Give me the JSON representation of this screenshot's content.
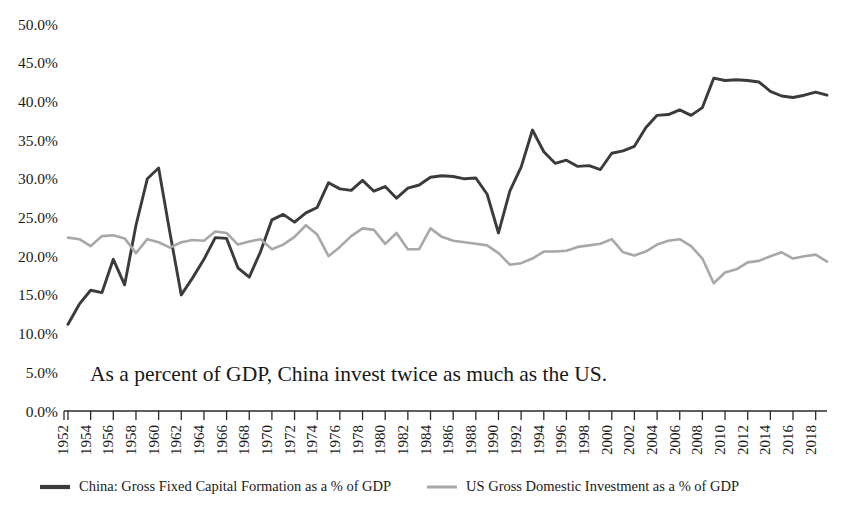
{
  "annotation": {
    "text": "As a percent of GDP, China invest twice as much as the US."
  },
  "axes": {
    "y_tick_labels": [
      "50.0%",
      "45.0%",
      "40.0%",
      "35.0%",
      "30.0%",
      "25.0%",
      "20.0%",
      "15.0%",
      "10.0%",
      "5.0%",
      "0.0%"
    ],
    "x_tick_labels": [
      "1952",
      "1954",
      "1956",
      "1958",
      "1960",
      "1962",
      "1964",
      "1966",
      "1968",
      "1970",
      "1972",
      "1974",
      "1976",
      "1978",
      "1980",
      "1982",
      "1984",
      "1986",
      "1988",
      "1990",
      "1992",
      "1994",
      "1996",
      "1998",
      "2000",
      "2002",
      "2004",
      "2006",
      "2008",
      "2010",
      "2012",
      "2014",
      "2016",
      "2018"
    ]
  },
  "legend": {
    "items": [
      {
        "label": "China: Gross Fixed Capital Formation as a % of GDP",
        "color": "#3b3b3b"
      },
      {
        "label": "US Gross Domestic Investment as a % of GDP",
        "color": "#a8a8a8"
      }
    ]
  },
  "colors": {
    "china_line": "#3b3b3b",
    "us_line": "#a8a8a8",
    "axis": "#2a2a2a",
    "text": "#1b1b1b",
    "background": "#ffffff"
  },
  "chart_data": {
    "type": "line",
    "title": "",
    "subtitle": "",
    "annotation": "As a percent of GDP, China invest twice as much as the US.",
    "xlabel": "",
    "ylabel": "",
    "ylim": [
      0,
      50
    ],
    "ytick_step": 5,
    "ytick_format": "percent",
    "xlim": [
      1952,
      2019
    ],
    "xtick_step": 2,
    "grid": false,
    "legend_position": "bottom",
    "x": [
      1952,
      1953,
      1954,
      1955,
      1956,
      1957,
      1958,
      1959,
      1960,
      1961,
      1962,
      1963,
      1964,
      1965,
      1966,
      1967,
      1968,
      1969,
      1970,
      1971,
      1972,
      1973,
      1974,
      1975,
      1976,
      1977,
      1978,
      1979,
      1980,
      1981,
      1982,
      1983,
      1984,
      1985,
      1986,
      1987,
      1988,
      1989,
      1990,
      1991,
      1992,
      1993,
      1994,
      1995,
      1996,
      1997,
      1998,
      1999,
      2000,
      2001,
      2002,
      2003,
      2004,
      2005,
      2006,
      2007,
      2008,
      2009,
      2010,
      2011,
      2012,
      2013,
      2014,
      2015,
      2016,
      2017,
      2018,
      2019
    ],
    "series": [
      {
        "name": "China: Gross Fixed Capital Formation as a % of GDP",
        "color": "#3b3b3b",
        "values": [
          11.2,
          13.8,
          15.6,
          15.3,
          19.6,
          16.3,
          24.0,
          30.0,
          31.4,
          23.0,
          15.0,
          17.2,
          19.6,
          22.4,
          22.3,
          18.5,
          17.3,
          20.6,
          24.7,
          25.4,
          24.4,
          25.6,
          26.3,
          29.5,
          28.7,
          28.5,
          29.8,
          28.4,
          29.0,
          27.5,
          28.8,
          29.2,
          30.2,
          30.4,
          30.3,
          30.0,
          30.1,
          28.0,
          23.0,
          28.4,
          31.5,
          36.3,
          33.5,
          32.0,
          32.4,
          31.6,
          31.7,
          31.2,
          33.3,
          33.6,
          34.2,
          36.6,
          38.2,
          38.3,
          38.9,
          38.2,
          39.2,
          43.0,
          42.7,
          42.8,
          42.7,
          42.5,
          41.3,
          40.7,
          40.5,
          40.8,
          41.2,
          40.8
        ]
      },
      {
        "name": "US Gross Domestic Investment as a % of GDP",
        "color": "#a8a8a8",
        "values": [
          22.4,
          22.2,
          21.3,
          22.6,
          22.7,
          22.3,
          20.4,
          22.2,
          21.8,
          21.1,
          21.8,
          22.1,
          22.0,
          23.2,
          23.0,
          21.5,
          21.9,
          22.2,
          20.9,
          21.5,
          22.5,
          24.0,
          22.8,
          20.0,
          21.2,
          22.6,
          23.6,
          23.4,
          21.6,
          23.0,
          20.9,
          20.9,
          23.6,
          22.5,
          22.0,
          21.8,
          21.6,
          21.4,
          20.4,
          18.9,
          19.1,
          19.7,
          20.6,
          20.6,
          20.7,
          21.2,
          21.4,
          21.6,
          22.2,
          20.5,
          20.1,
          20.6,
          21.5,
          22.0,
          22.2,
          21.3,
          19.7,
          16.5,
          17.9,
          18.3,
          19.2,
          19.4,
          20.0,
          20.5,
          19.7,
          20.0,
          20.2,
          19.3
        ]
      }
    ]
  },
  "plot_geometry": {
    "x0": 68,
    "x1": 827,
    "y_zero": 411,
    "y_fifty": 24
  }
}
